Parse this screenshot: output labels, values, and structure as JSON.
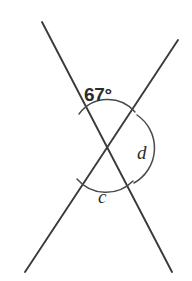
{
  "figure": {
    "type": "intersecting-lines-angle-diagram",
    "background_color": "#ffffff",
    "line_color": "#3a3a3a",
    "arc_color": "#4a4a4a",
    "label_color": "#2b2b2b",
    "intersection": {
      "x": 106,
      "y": 148
    },
    "lines": [
      {
        "name": "line-top-left-to-bottom-right",
        "x1": 42,
        "y1": 22,
        "x2": 172,
        "y2": 272
      },
      {
        "name": "line-top-right-to-bottom-left",
        "x1": 178,
        "y1": 40,
        "x2": 25,
        "y2": 272
      }
    ],
    "arcs": [
      {
        "name": "arc-angle-67",
        "path": "M 79 114 A 36 36 0 0 1 135 112"
      },
      {
        "name": "arc-angle-d",
        "path": "M 137 115 A 40 40 0 0 1 134 183"
      },
      {
        "name": "arc-angle-c",
        "path": "M 77 179 A 38 38 0 0 0 133 181"
      }
    ],
    "labels": [
      {
        "name": "angle-label-67",
        "text": "67°",
        "style": "degree",
        "x": 84,
        "y": 85
      },
      {
        "name": "angle-label-d",
        "text": "d",
        "style": "variable",
        "x": 137,
        "y": 143
      },
      {
        "name": "angle-label-c",
        "text": "c",
        "style": "variable",
        "x": 98,
        "y": 187
      }
    ]
  }
}
